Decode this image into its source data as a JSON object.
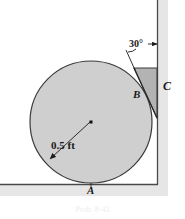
{
  "figure": {
    "caption": "Prob. 8-43",
    "labels": {
      "contact_ground": "A",
      "contact_wedge": "B",
      "contact_wall": "C",
      "angle": "30°",
      "radius": "0.5 ft"
    },
    "colors": {
      "circle_fill": "#cfcfcf",
      "circle_stroke": "#3a3a3a",
      "wedge_fill": "#b3b3b3",
      "wedge_stroke": "#3a3a3a",
      "ground_stroke": "#4a4a4a",
      "ground_band": "#e2e2e2",
      "wall_stroke": "#4a4a4a",
      "wall_band": "#e2e2e2",
      "leader_stroke": "#1a1a1a",
      "text": "#1a1a1a"
    },
    "geometry": {
      "circle_center_x": 91,
      "circle_center_y": 122,
      "circle_radius": 61,
      "ground_y": 184,
      "wall_x": 157,
      "wedge_top_y": 68,
      "wedge_tip_y": 118,
      "wedge_left_x": 134,
      "angle_degrees": 30
    }
  }
}
